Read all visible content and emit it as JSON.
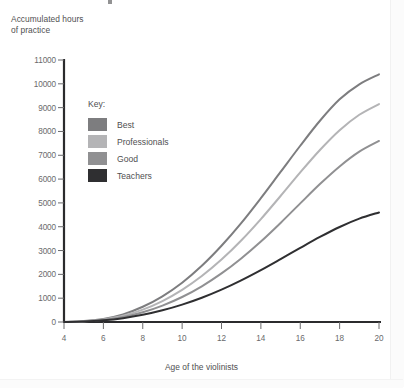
{
  "axes": {
    "y_title": "Accumulated hours\nof practice",
    "x_title": "Age of the violinists"
  },
  "legend": {
    "title": "Key:",
    "entries": [
      {
        "label": "Best",
        "color": "#7d7d7f"
      },
      {
        "label": "Professionals",
        "color": "#b4b4b6"
      },
      {
        "label": "Good",
        "color": "#909092"
      },
      {
        "label": "Teachers",
        "color": "#2f2f31"
      }
    ]
  },
  "chart_data": {
    "type": "line",
    "title": "",
    "xlabel": "Age of the violinists",
    "ylabel": "Accumulated hours of practice",
    "xlim": [
      4,
      20
    ],
    "ylim": [
      0,
      11000
    ],
    "xticks": [
      4,
      6,
      8,
      10,
      12,
      14,
      16,
      18,
      20
    ],
    "yticks": [
      0,
      1000,
      2000,
      3000,
      4000,
      5000,
      6000,
      7000,
      8000,
      9000,
      10000,
      11000
    ],
    "grid": false,
    "legend_position": "inside-upper-left",
    "x": [
      4,
      5,
      6,
      7,
      8,
      9,
      10,
      11,
      12,
      13,
      14,
      15,
      16,
      17,
      18,
      19,
      20
    ],
    "series": [
      {
        "name": "Best",
        "color": "#7d7d7f",
        "values": [
          0,
          40,
          130,
          320,
          640,
          1080,
          1650,
          2360,
          3200,
          4150,
          5200,
          6300,
          7400,
          8450,
          9350,
          9980,
          10400
        ]
      },
      {
        "name": "Professionals",
        "color": "#b4b4b6",
        "values": [
          0,
          30,
          110,
          260,
          520,
          880,
          1350,
          1930,
          2620,
          3420,
          4320,
          5290,
          6280,
          7220,
          8050,
          8700,
          9150
        ]
      },
      {
        "name": "Good",
        "color": "#909092",
        "values": [
          0,
          25,
          90,
          210,
          410,
          690,
          1050,
          1500,
          2040,
          2670,
          3380,
          4160,
          4980,
          5790,
          6530,
          7150,
          7600
        ]
      },
      {
        "name": "Teachers",
        "color": "#2f2f31",
        "values": [
          0,
          20,
          70,
          160,
          300,
          490,
          730,
          1020,
          1360,
          1750,
          2180,
          2640,
          3110,
          3570,
          3990,
          4340,
          4600
        ]
      }
    ]
  }
}
